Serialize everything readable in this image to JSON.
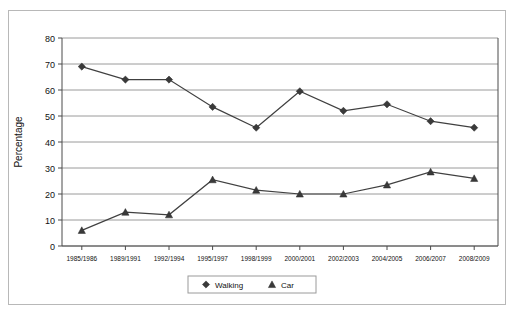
{
  "chart_data": {
    "type": "line",
    "title": "",
    "xlabel": "",
    "ylabel": "Percentage",
    "ylim": [
      0,
      80
    ],
    "ytick_step": 10,
    "grid": true,
    "legend_position": "bottom",
    "categories": [
      "1985/1986",
      "1989/1991",
      "1992/1994",
      "1995/1997",
      "1998/1999",
      "2000/2001",
      "2002/2003",
      "2004/2005",
      "2006/2007",
      "2008/2009"
    ],
    "yticks": [
      "0",
      "10",
      "20",
      "30",
      "40",
      "50",
      "60",
      "70",
      "80"
    ],
    "series": [
      {
        "name": "Walking",
        "marker": "diamond",
        "color": "#3a3a3a",
        "values": [
          69,
          64,
          64,
          53.5,
          45.5,
          59.5,
          52,
          54.5,
          48,
          45.5
        ]
      },
      {
        "name": "Car",
        "marker": "triangle",
        "color": "#3a3a3a",
        "values": [
          6,
          13,
          12,
          25.5,
          21.5,
          20,
          20,
          23.5,
          28.5,
          26
        ]
      }
    ]
  },
  "legend": {
    "entries": [
      {
        "label": "Walking",
        "marker": "diamond"
      },
      {
        "label": "Car",
        "marker": "triangle"
      }
    ]
  }
}
